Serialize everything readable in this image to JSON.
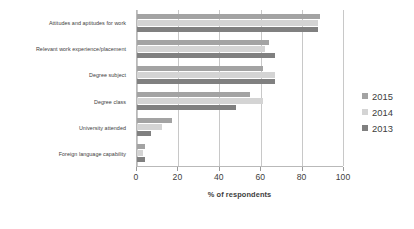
{
  "chart_data": {
    "type": "bar",
    "orientation": "horizontal",
    "title": "",
    "subtitle": "",
    "xlabel": "% of respondents",
    "ylabel": "",
    "xlim": [
      0,
      100
    ],
    "xticks": [
      0,
      20,
      40,
      60,
      80,
      100
    ],
    "grid": true,
    "legend_position": "right",
    "categories": [
      "Attitudes and aptitudes for work",
      "Relevant work experience/placement",
      "Degree subject",
      "Degree class",
      "University attended",
      "Foreign language capability"
    ],
    "series": [
      {
        "name": "2015",
        "color": "#a3a3a3",
        "values": [
          89,
          64,
          61,
          55,
          17,
          4
        ]
      },
      {
        "name": "2014",
        "color": "#d4d4d4",
        "values": [
          88,
          62,
          67,
          61,
          12,
          3
        ]
      },
      {
        "name": "2013",
        "color": "#808080",
        "values": [
          88,
          67,
          67,
          48,
          7,
          4
        ]
      }
    ]
  },
  "legend": {
    "items": [
      {
        "label": "2015",
        "color": "#a3a3a3"
      },
      {
        "label": "2014",
        "color": "#d4d4d4"
      },
      {
        "label": "2013",
        "color": "#808080"
      }
    ]
  },
  "axis": {
    "x_title": "% of respondents",
    "x_tick_labels": [
      "0",
      "20",
      "40",
      "60",
      "80",
      "100"
    ]
  },
  "colors": {
    "background": "#ffffff",
    "gridline": "#c8c8c8",
    "axis_line": "#b9b9b9",
    "text": "#3d3d3d"
  }
}
